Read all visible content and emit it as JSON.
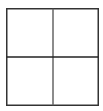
{
  "icon": {
    "name": "grid-2x2-icon",
    "rows": 2,
    "columns": 2,
    "stroke_color": "#333333",
    "divider_color_vertical": "#666666",
    "divider_color_horizontal": "#222222",
    "background": "#ffffff"
  }
}
